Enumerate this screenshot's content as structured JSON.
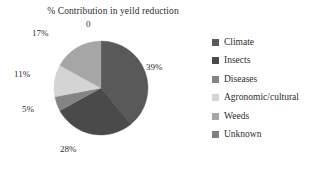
{
  "chart_data": {
    "type": "pie",
    "title": "% Contribution in yeild reduction",
    "categories": [
      "Climate",
      "Insects",
      "Diseases",
      "Agronomic/cultural",
      "Weeds",
      "Unknown"
    ],
    "values": [
      39,
      28,
      5,
      11,
      17,
      0
    ],
    "value_labels": [
      "39%",
      "28%",
      "5%",
      "11%",
      "17%",
      "0"
    ],
    "colors": [
      "#595959",
      "#4a4a4a",
      "#848484",
      "#d4d4d4",
      "#a6a6a6",
      "#7f7f7f"
    ],
    "start_angle_deg": 0,
    "direction": "clockwise",
    "legend_position": "right",
    "grid": false,
    "xlabel": "",
    "ylabel": ""
  },
  "labels": {
    "climate": "39%",
    "insects": "28%",
    "diseases": "5%",
    "agronomic": "11%",
    "weeds": "17%",
    "unknown": "0"
  },
  "legend": {
    "items": [
      {
        "label": "Climate",
        "color": "#595959"
      },
      {
        "label": "Insects",
        "color": "#4a4a4a"
      },
      {
        "label": "Diseases",
        "color": "#848484"
      },
      {
        "label": "Agronomic/cultural",
        "color": "#d4d4d4"
      },
      {
        "label": "Weeds",
        "color": "#a6a6a6"
      },
      {
        "label": "Unknown",
        "color": "#7f7f7f"
      }
    ]
  }
}
